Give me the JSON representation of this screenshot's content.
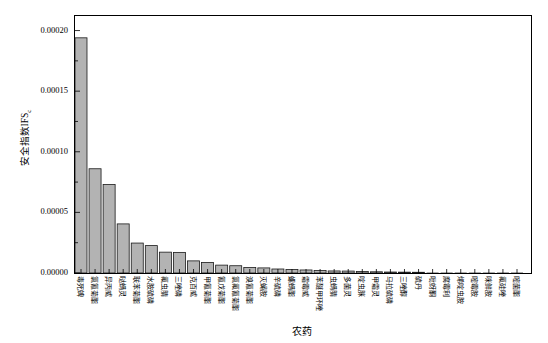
{
  "figure": {
    "background": "#ffffff",
    "axis_color": "#000000"
  },
  "chart_data": {
    "type": "bar",
    "title": "",
    "xlabel": "农药",
    "ylabel": "安全指数IFS",
    "ylabel_subscript": "c",
    "ylim": [
      0,
      0.000212
    ],
    "yticks": [
      "0.00000",
      "0.00005",
      "0.00010",
      "0.00015",
      "0.00020"
    ],
    "ytick_values": [
      0,
      5e-05,
      0.0001,
      0.00015,
      0.0002
    ],
    "minor_ytick_values": [
      2.5e-05,
      7.5e-05,
      0.000125,
      0.000175
    ],
    "grid": false,
    "legend": null,
    "bar_fill": "#b3b3b3",
    "bar_stroke": "#1a1a1a",
    "categories": [
      "毒死蜱",
      "氯氰菊酯",
      "异丙威",
      "哒螨灵",
      "联苯菊酯",
      "水胺硫磷",
      "氟虫腈",
      "三唑磷",
      "克百威",
      "甲氰菊酯",
      "氰戊菊酯",
      "氯氟氰菊酯",
      "溴氰菊酯",
      "灭蝇胺",
      "辛硫磷",
      "螺螨酯",
      "霜霉威",
      "苯醚甲环唑",
      "虫螨腈",
      "多菌灵",
      "啶虫脒",
      "甲霜灵",
      "马拉硫磷",
      "三唑醇",
      "硫丹",
      "吡蚜酮",
      "腐霉利",
      "烯啶虫胺",
      "嘧霉胺",
      "咪鲜胺",
      "氟硅唑",
      "嘧菌酯"
    ],
    "values": [
      0.000194,
      8.6e-05,
      7.3e-05,
      4.05e-05,
      2.47e-05,
      2.26e-05,
      1.72e-05,
      1.7e-05,
      1e-05,
      8.7e-06,
      6.5e-06,
      6e-06,
      4.5e-06,
      4.2e-06,
      3.3e-06,
      2.9e-06,
      2.5e-06,
      2.1e-06,
      1.7e-06,
      1.6e-06,
      1.2e-06,
      1e-06,
      8e-07,
      7e-07,
      6e-07,
      5e-07,
      4e-07,
      3e-07,
      2.5e-07,
      2e-07,
      1.5e-07,
      1e-07
    ]
  }
}
